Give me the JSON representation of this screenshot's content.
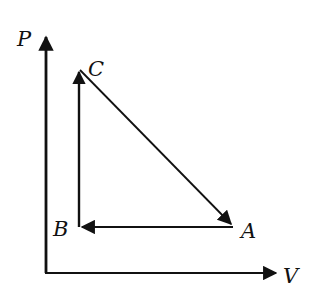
{
  "diagram": {
    "type": "pv-diagram",
    "axes": {
      "y_label": "P",
      "x_label": "V"
    },
    "points": [
      {
        "id": "A",
        "label": "A"
      },
      {
        "id": "B",
        "label": "B"
      },
      {
        "id": "C",
        "label": "C"
      }
    ],
    "process_path": [
      {
        "from": "A",
        "to": "B",
        "kind": "isobaric"
      },
      {
        "from": "B",
        "to": "C",
        "kind": "isochoric"
      },
      {
        "from": "C",
        "to": "A",
        "kind": "linear"
      }
    ],
    "colors": {
      "stroke": "#111111",
      "background": "#ffffff"
    }
  }
}
